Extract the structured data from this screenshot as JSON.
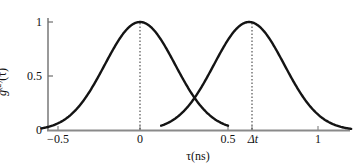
{
  "chart_data": {
    "type": "line",
    "title": "",
    "xlabel": "τ(ns)",
    "ylabel": "g⁽²⁾(τ)",
    "ylabel_base": "g",
    "ylabel_sup": "(2)",
    "ylabel_arg": "(τ)",
    "xlim": [
      -0.68,
      1.27
    ],
    "ylim": [
      0,
      1.08
    ],
    "grid": false,
    "legend": false,
    "xticks": [
      -0.5,
      0,
      0.5,
      0.62,
      1
    ],
    "xticklabels": [
      "−0.5",
      "0",
      "0.5",
      "Δt",
      "1"
    ],
    "yticks": [
      0,
      0.5,
      1
    ],
    "yticklabels": [
      "0",
      "0.5",
      "1"
    ],
    "series": [
      {
        "name": "pulse-1",
        "shape": "gaussian",
        "center": 0,
        "amplitude": 1,
        "sigma": 0.2,
        "x_start": -0.56,
        "x_end": 0.5,
        "peak_marker": "dotted-vertical"
      },
      {
        "name": "pulse-2",
        "shape": "gaussian",
        "center": 0.62,
        "amplitude": 1,
        "sigma": 0.2,
        "x_start": 0.12,
        "x_end": 1.2,
        "peak_marker": "dotted-vertical"
      }
    ],
    "annotations": [
      {
        "name": "peak-line-tau-0",
        "x": 0,
        "y_from": 0,
        "y_to": 1,
        "style": "dotted"
      },
      {
        "name": "peak-line-delta-t",
        "x": 0.62,
        "y_from": 0,
        "y_to": 1,
        "style": "dotted"
      }
    ],
    "colors": {
      "curve": "#1a1a1a",
      "axis": "#808080",
      "dotted": "#333333",
      "background": "#ffffff"
    }
  }
}
